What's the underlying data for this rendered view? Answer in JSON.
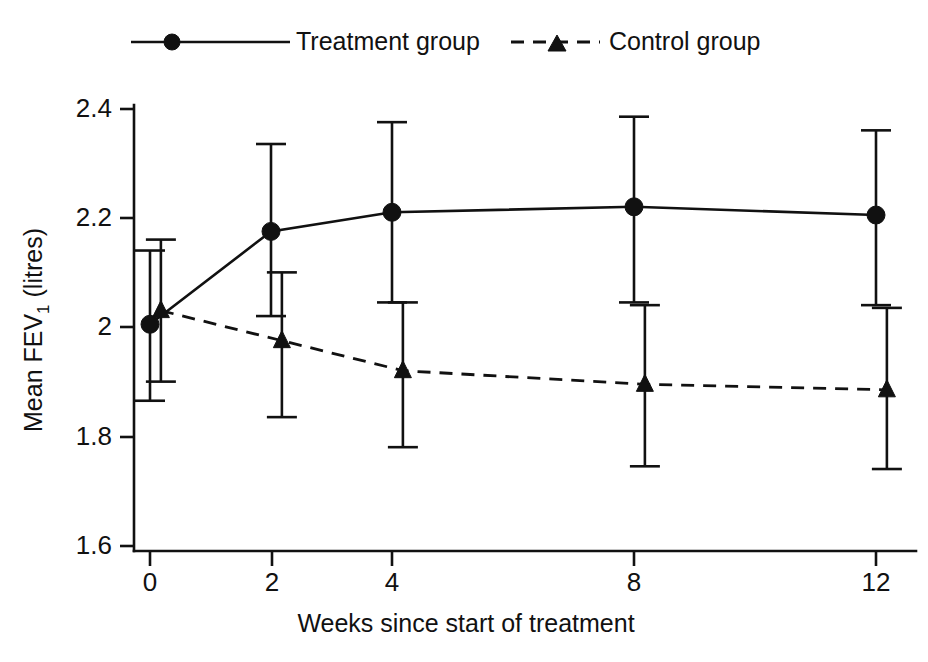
{
  "chart_data": {
    "type": "line",
    "title": "",
    "xlabel": "Weeks since start of treatment",
    "ylabel": "Mean FEV1 (litres)",
    "ylabel_main": "Mean FEV",
    "ylabel_sub": "1",
    "ylabel_tail": " (litres)",
    "x": [
      0,
      2,
      4,
      8,
      12
    ],
    "xtick_labels": [
      "0",
      "2",
      "4",
      "8",
      "12"
    ],
    "ytick_labels": [
      "1.6",
      "1.8",
      "2",
      "2.2",
      "2.4"
    ],
    "ytick_values": [
      1.6,
      1.8,
      2.0,
      2.2,
      2.4
    ],
    "xlim": [
      -0.3,
      12.6
    ],
    "ylim": [
      1.56,
      2.45
    ],
    "grid": false,
    "legend_position": "top",
    "error_bars": "95% CI (vertical capped bars)",
    "series": [
      {
        "name": "Treatment group",
        "marker": "circle",
        "linestyle": "solid",
        "color": "#111111",
        "x_offset": 0,
        "values": [
          2.005,
          2.175,
          2.21,
          2.22,
          2.205
        ],
        "err_low": [
          1.865,
          2.02,
          2.045,
          2.045,
          2.04
        ],
        "err_high": [
          2.14,
          2.335,
          2.375,
          2.385,
          2.36
        ]
      },
      {
        "name": "Control group",
        "marker": "triangle",
        "linestyle": "dashed",
        "color": "#111111",
        "x_offset": 0.18,
        "values": [
          2.03,
          1.975,
          1.92,
          1.895,
          1.885
        ],
        "err_low": [
          1.9,
          1.835,
          1.78,
          1.745,
          1.74
        ],
        "err_high": [
          2.16,
          2.1,
          2.045,
          2.04,
          2.035
        ]
      }
    ]
  },
  "legend": {
    "items": [
      {
        "label": "Treatment group",
        "marker": "circle",
        "linestyle": "solid"
      },
      {
        "label": "Control group",
        "marker": "triangle",
        "linestyle": "dashed"
      }
    ]
  }
}
